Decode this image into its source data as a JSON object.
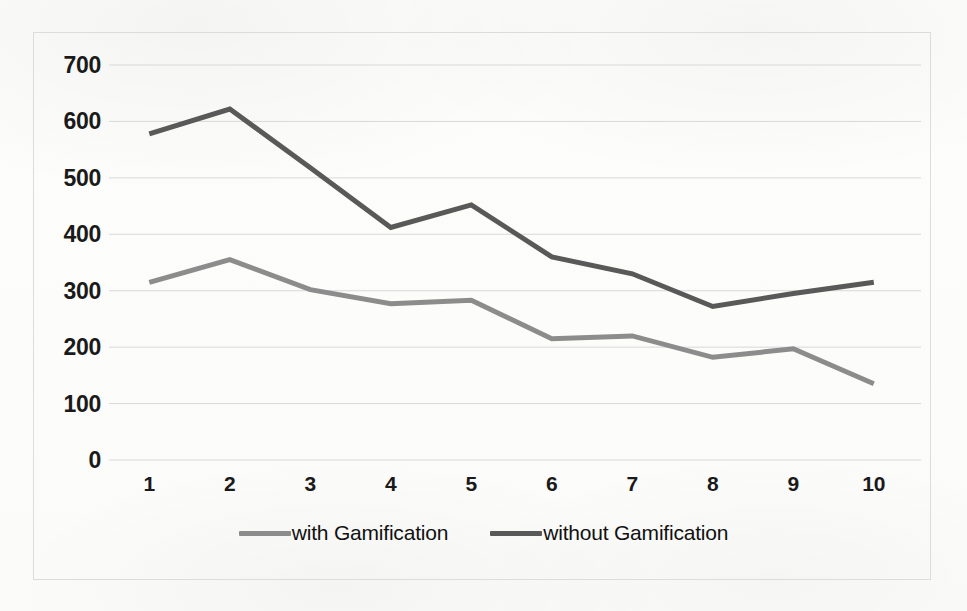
{
  "chart_data": {
    "type": "line",
    "title": "",
    "subtitle": "",
    "xlabel": "",
    "ylabel": "",
    "categories": [
      "1",
      "2",
      "3",
      "4",
      "5",
      "6",
      "7",
      "8",
      "9",
      "10"
    ],
    "x": [
      1,
      2,
      3,
      4,
      5,
      6,
      7,
      8,
      9,
      10
    ],
    "series": [
      {
        "name": "with Gamification",
        "color": "#8c8c8c",
        "values": [
          315,
          355,
          302,
          277,
          283,
          215,
          220,
          182,
          197,
          135
        ]
      },
      {
        "name": "without Gamification",
        "color": "#595959",
        "values": [
          578,
          622,
          518,
          412,
          452,
          360,
          330,
          272,
          295,
          315
        ]
      }
    ],
    "ylim": [
      0,
      700
    ],
    "ytick_labels": [
      "700",
      "600",
      "500",
      "400",
      "300",
      "200",
      "100",
      "0"
    ],
    "ytick_values": [
      700,
      600,
      500,
      400,
      300,
      200,
      100,
      0
    ],
    "ytick_step": 100,
    "grid": true,
    "grid_color": "#d9d9d9",
    "legend_position": "bottom",
    "border_color": "#dcdcdc",
    "background": "#ffffff",
    "markers": false,
    "line_width": 5
  },
  "legend": {
    "entries": [
      {
        "label": "with Gamification",
        "swatch_name": "legend-swatch-with-gamification"
      },
      {
        "label": "without Gamification",
        "swatch_name": "legend-swatch-without-gamification"
      }
    ]
  }
}
